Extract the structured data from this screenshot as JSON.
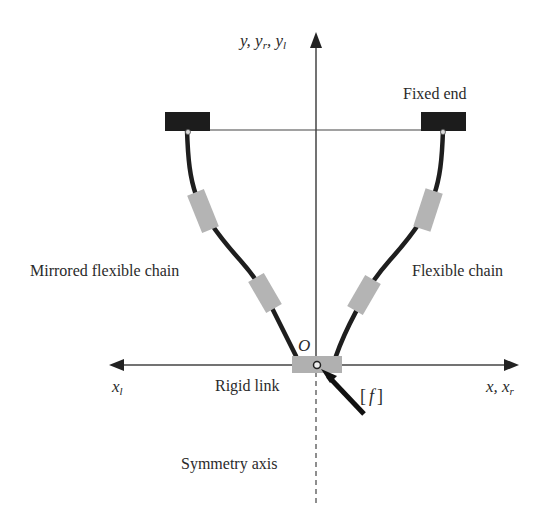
{
  "diagram": {
    "type": "schematic",
    "colors": {
      "background": "#ffffff",
      "axis": "#444444",
      "chain": "#1e1e1e",
      "module": "#b4b4b4",
      "fixed_block": "#1c1c1c",
      "rigid_link": "#b0b0b0",
      "text": "#2a2a2a"
    },
    "axes": {
      "vertical_label": "y, y",
      "vertical_label_sub_r": "r",
      "vertical_label_sep": ", y",
      "vertical_label_sub_l": "l",
      "left_label": "x",
      "left_label_sub": "l",
      "right_label": "x, x",
      "right_label_sub": "r",
      "origin_label": "O"
    },
    "labels": {
      "fixed_end": "Fixed end",
      "mirrored_chain": "Mirrored flexible chain",
      "flexible_chain": "Flexible chain",
      "rigid_link": "Rigid link",
      "symmetry_axis": "Symmetry axis",
      "force_open": "[",
      "force_symbol": "f",
      "force_close": "]"
    }
  }
}
